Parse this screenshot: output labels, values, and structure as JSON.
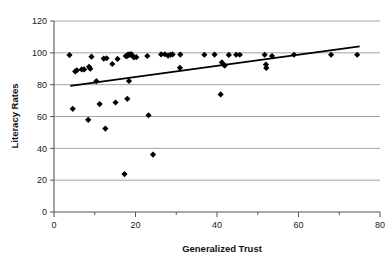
{
  "chart_data": {
    "type": "scatter",
    "title": "",
    "xlabel": "Generalized Trust",
    "ylabel": "Literacy Rates",
    "xlim": [
      0,
      80
    ],
    "ylim": [
      0,
      120
    ],
    "xticks": [
      0,
      20,
      40,
      60,
      80
    ],
    "yticks": [
      0,
      20,
      40,
      60,
      80,
      100,
      120
    ],
    "xtick_labels": [
      "0",
      "20",
      "40",
      "60",
      "80"
    ],
    "ytick_labels": [
      "0",
      "20",
      "40",
      "60",
      "80",
      "100",
      "120"
    ],
    "x_minor_tick_step": 10,
    "grid": "horizontal",
    "legend": "none",
    "marker": "diamond",
    "marker_color": "#000000",
    "grid_color": "#8c8c8c",
    "axis_color": "#555555",
    "points": [
      {
        "x": 3.8,
        "y": 98.6
      },
      {
        "x": 4.6,
        "y": 64.8
      },
      {
        "x": 5.2,
        "y": 88.3
      },
      {
        "x": 5.6,
        "y": 89.0
      },
      {
        "x": 6.8,
        "y": 89.6
      },
      {
        "x": 7.4,
        "y": 89.6
      },
      {
        "x": 8.4,
        "y": 57.9
      },
      {
        "x": 8.6,
        "y": 91.2
      },
      {
        "x": 8.9,
        "y": 90.0
      },
      {
        "x": 9.2,
        "y": 97.6
      },
      {
        "x": 10.4,
        "y": 82.2
      },
      {
        "x": 11.2,
        "y": 67.8
      },
      {
        "x": 12.2,
        "y": 96.4
      },
      {
        "x": 12.6,
        "y": 52.4
      },
      {
        "x": 12.9,
        "y": 96.6
      },
      {
        "x": 14.3,
        "y": 93.0
      },
      {
        "x": 15.1,
        "y": 68.8
      },
      {
        "x": 15.6,
        "y": 96.2
      },
      {
        "x": 17.3,
        "y": 23.8
      },
      {
        "x": 17.6,
        "y": 98.0
      },
      {
        "x": 17.9,
        "y": 97.9
      },
      {
        "x": 18.0,
        "y": 71.1
      },
      {
        "x": 18.2,
        "y": 99.0
      },
      {
        "x": 18.4,
        "y": 82.3
      },
      {
        "x": 18.6,
        "y": 98.7
      },
      {
        "x": 18.9,
        "y": 99.2
      },
      {
        "x": 19.2,
        "y": 98.4
      },
      {
        "x": 19.6,
        "y": 97.2
      },
      {
        "x": 20.2,
        "y": 97.3
      },
      {
        "x": 22.9,
        "y": 98.0
      },
      {
        "x": 23.2,
        "y": 60.8
      },
      {
        "x": 24.3,
        "y": 36.1
      },
      {
        "x": 26.3,
        "y": 99.0
      },
      {
        "x": 27.2,
        "y": 99.1
      },
      {
        "x": 28.0,
        "y": 98.2
      },
      {
        "x": 28.6,
        "y": 98.8
      },
      {
        "x": 29.1,
        "y": 99.0
      },
      {
        "x": 30.9,
        "y": 90.6
      },
      {
        "x": 31.0,
        "y": 98.9
      },
      {
        "x": 36.9,
        "y": 98.8
      },
      {
        "x": 39.4,
        "y": 98.9
      },
      {
        "x": 40.9,
        "y": 73.9
      },
      {
        "x": 41.2,
        "y": 94.0
      },
      {
        "x": 41.6,
        "y": 92.8
      },
      {
        "x": 41.9,
        "y": 92.0
      },
      {
        "x": 42.9,
        "y": 98.7
      },
      {
        "x": 44.7,
        "y": 98.8
      },
      {
        "x": 45.6,
        "y": 98.8
      },
      {
        "x": 51.7,
        "y": 98.8
      },
      {
        "x": 52.0,
        "y": 92.6
      },
      {
        "x": 52.1,
        "y": 90.5
      },
      {
        "x": 53.5,
        "y": 98.0
      },
      {
        "x": 58.9,
        "y": 98.8
      },
      {
        "x": 68.0,
        "y": 98.8
      },
      {
        "x": 74.4,
        "y": 98.8
      }
    ],
    "trendline": {
      "x_start": 4.0,
      "y_start": 79.2,
      "x_end": 75.0,
      "y_end": 104.0,
      "color": "#000000"
    }
  }
}
